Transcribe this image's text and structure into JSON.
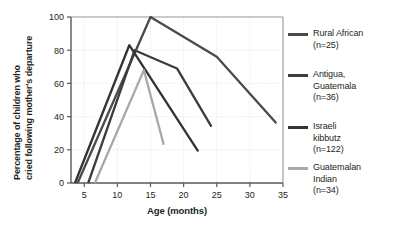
{
  "chart_data": {
    "type": "line",
    "title": "",
    "xlabel": "Age (months)",
    "ylabel": "Percentage of children who cried following mother's departure",
    "ylabel_line1": "Percentage of children who",
    "ylabel_line2": "cried following mother's departure",
    "xlim": [
      3,
      35
    ],
    "ylim": [
      0,
      100
    ],
    "xticks": [
      5,
      10,
      15,
      20,
      25,
      30,
      35
    ],
    "yticks": [
      0,
      20,
      40,
      60,
      80,
      100
    ],
    "grid": true,
    "legend_position": "right",
    "series": [
      {
        "name": "Rural African",
        "n_label": "(n=25)",
        "color": "#4a4a4a",
        "points": [
          [
            4.0,
            0
          ],
          [
            15.0,
            100
          ],
          [
            25.0,
            76
          ],
          [
            34.0,
            36
          ]
        ]
      },
      {
        "name": "Antigua, Guatemala",
        "name_line1": "Antigua,",
        "name_line2": "Guatemala",
        "n_label": "(n=36)",
        "color": "#3d3d3d",
        "points": [
          [
            5.6,
            0
          ],
          [
            12.6,
            80
          ],
          [
            19.0,
            69
          ],
          [
            24.2,
            34
          ]
        ]
      },
      {
        "name": "Israeli kibbutz",
        "name_line1": "Israeli",
        "name_line2": "kibbutz",
        "n_label": "(n=122)",
        "color": "#333333",
        "points": [
          [
            3.6,
            0
          ],
          [
            11.8,
            83
          ],
          [
            22.2,
            19
          ]
        ]
      },
      {
        "name": "Guatemalan Indian",
        "name_line1": "Guatemalan",
        "name_line2": "Indian",
        "n_label": "(n=34)",
        "color": "#a8a8a8",
        "points": [
          [
            6.6,
            0
          ],
          [
            14.0,
            68
          ],
          [
            17.0,
            23
          ]
        ]
      }
    ]
  },
  "axes": {
    "xlabel": "Age (months)",
    "ylabel_line1": "Percentage of children who",
    "ylabel_line2": "cried following mother's departure",
    "xticks": [
      "5",
      "10",
      "15",
      "20",
      "25",
      "30",
      "35"
    ],
    "yticks": [
      "0",
      "20",
      "40",
      "60",
      "80",
      "100"
    ]
  },
  "legend": {
    "items": [
      {
        "line1": "Rural African",
        "line2": "(n=25)",
        "line3": "",
        "color": "#4a4a4a"
      },
      {
        "line1": "Antigua,",
        "line2": "Guatemala",
        "line3": "(n=36)",
        "color": "#3d3d3d"
      },
      {
        "line1": "Israeli",
        "line2": "kibbutz",
        "line3": "(n=122)",
        "color": "#333333"
      },
      {
        "line1": "Guatemalan",
        "line2": "Indian",
        "line3": "(n=34)",
        "color": "#a8a8a8"
      }
    ]
  },
  "colors": {
    "axis": "#58595b",
    "grid": "#d9d9d9",
    "text": "#231f20",
    "background": "#ffffff"
  }
}
